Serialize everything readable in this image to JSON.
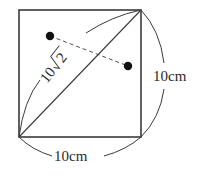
{
  "diagram": {
    "type": "square-with-diagonal",
    "square": {
      "x": 19,
      "y": 10,
      "size_w": 122,
      "size_h": 127
    },
    "labels": {
      "bottom_side": "10cm",
      "right_side": "10cm",
      "diagonal_coef": "10",
      "diagonal_radicand": "2"
    },
    "points": [
      {
        "name": "dot-upper-left",
        "x": 50,
        "y": 36
      },
      {
        "name": "dot-right",
        "x": 128,
        "y": 66
      }
    ],
    "colors": {
      "line": "#3a3a3a",
      "text": "#2a2a2a",
      "background": "#ffffff"
    }
  }
}
